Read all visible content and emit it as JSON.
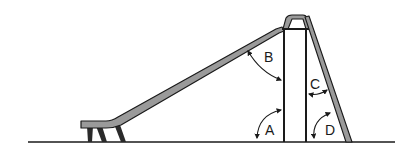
{
  "diagram": {
    "angle_labels": {
      "A": "A",
      "B": "B",
      "C": "C",
      "D": "D"
    },
    "colors": {
      "outline": "#1a1a1a",
      "fill": "#9a9a9a",
      "background": "#ffffff"
    }
  }
}
